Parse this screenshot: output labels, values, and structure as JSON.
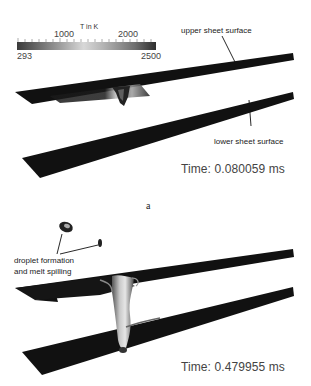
{
  "colorbar": {
    "title": "T in K",
    "min_label": "293",
    "max_label": "2500",
    "tick_labels": [
      "1000",
      "2000"
    ],
    "colors": [
      "#3a3a3a",
      "#d8d8d8",
      "#2e2e2e"
    ]
  },
  "panel_a": {
    "annotations": {
      "upper": "upper sheet surface",
      "lower": "lower sheet surface"
    },
    "time": "Time: 0.080059 ms",
    "label": "a"
  },
  "panel_b": {
    "annotations": {
      "droplet_line1": "droplet formation",
      "droplet_line2": "and melt spilling"
    },
    "time": "Time: 0.479955 ms"
  }
}
